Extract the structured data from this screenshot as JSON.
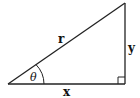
{
  "diagram": {
    "type": "right-triangle",
    "labels": {
      "hypotenuse": "r",
      "opposite": "y",
      "adjacent": "x",
      "angle": "θ"
    },
    "stroke_color": "#222222",
    "background": "#ffffff"
  }
}
